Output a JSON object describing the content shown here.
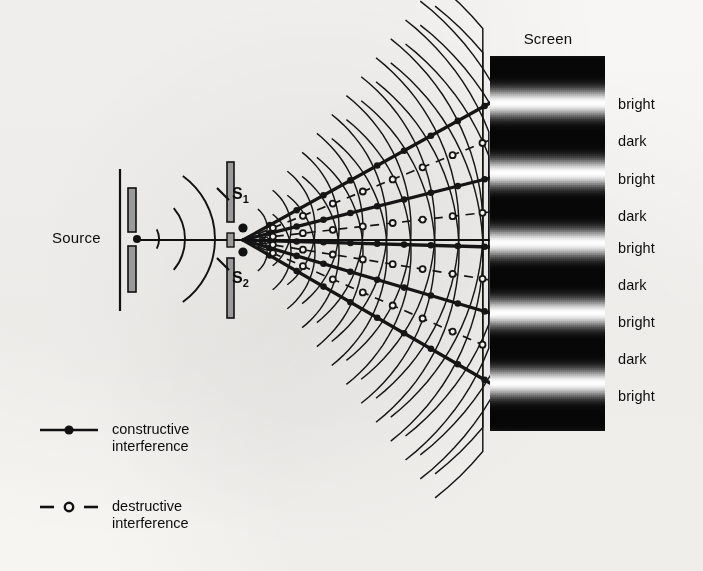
{
  "figure": {
    "title_visible": false,
    "background_color": "#f6f5f3",
    "ink_color": "#111111",
    "barrier_fill": "#9a9a9a"
  },
  "source": {
    "label": "Source",
    "label_x": 52,
    "label_y": 239,
    "wall_x": 120,
    "barrier_x": 128,
    "barrier_top": 188,
    "barrier_bottom": 292,
    "point_x": 137,
    "point_y": 239,
    "wavefront_arcs": 3
  },
  "slits": {
    "barrier_x": 227,
    "barrier_top": 162,
    "barrier_bottom": 318,
    "gap_top": 222,
    "gap_bottom": 258,
    "s1": {
      "label": "S",
      "sub": "1",
      "label_x": 232,
      "label_y": 196,
      "point_x": 243,
      "point_y": 228
    },
    "s2": {
      "label": "S",
      "sub": "2",
      "label_x": 232,
      "label_y": 280,
      "point_x": 243,
      "point_y": 252
    }
  },
  "screen": {
    "header": "Screen",
    "header_x": 548,
    "header_y": 40,
    "left": 490,
    "top": 56,
    "width": 115,
    "height": 375,
    "dark_color": "#0a0a0a",
    "bright_color": "#ffffff"
  },
  "chart_data": {
    "type": "line",
    "xlabel": "",
    "ylabel": "position on screen (px)",
    "grid": false,
    "legend_position": "bottom-left",
    "fringe_labels": [
      "bright",
      "dark",
      "bright",
      "dark",
      "bright",
      "dark",
      "bright",
      "dark",
      "bright"
    ],
    "fringe_types": [
      "bright",
      "dark",
      "bright",
      "dark",
      "bright",
      "dark",
      "bright",
      "dark",
      "bright"
    ],
    "fringe_label_x": 618,
    "fringe_label_y": [
      105,
      142,
      180,
      217,
      249,
      286,
      323,
      360,
      397
    ],
    "bright_band_y": [
      103,
      178,
      247,
      313,
      383
    ],
    "dark_band_y": [
      140,
      212,
      280,
      348
    ],
    "order_m": [
      2,
      1,
      0,
      -1,
      -2
    ],
    "central_axis_y": 240,
    "antinodal_line_count": 5,
    "nodal_line_count": 4,
    "wavefront_count_per_slit": 13
  },
  "legend": {
    "items": [
      {
        "name": "constructive",
        "line_style": "solid",
        "marker": "filled-dot",
        "text_line1": "constructive",
        "text_line2": "interference",
        "sample_x1": 40,
        "sample_x2": 98,
        "sample_y": 430,
        "text_x": 112,
        "text_y": 421
      },
      {
        "name": "destructive",
        "line_style": "dashed",
        "marker": "hollow-dot",
        "text_line1": "destructive",
        "text_line2": "interference",
        "sample_x1": 40,
        "sample_x2": 98,
        "sample_y": 507,
        "text_x": 112,
        "text_y": 498
      }
    ]
  }
}
